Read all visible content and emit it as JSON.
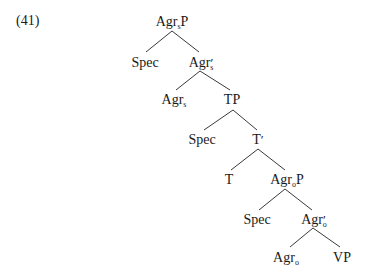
{
  "example": {
    "number": "(41)"
  },
  "tree": {
    "nodes": [
      {
        "id": "agrsp",
        "head": "Agr",
        "sub": "s",
        "suffix": "P",
        "prime": "",
        "x": 172,
        "y": 14
      },
      {
        "id": "spec1",
        "head": "Spec",
        "sub": "",
        "suffix": "",
        "prime": "",
        "x": 145,
        "y": 55
      },
      {
        "id": "agrsbar",
        "head": "Agr",
        "sub": "s",
        "suffix": "",
        "prime": "′",
        "x": 201,
        "y": 55
      },
      {
        "id": "agrs",
        "head": "Agr",
        "sub": "s",
        "suffix": "",
        "prime": "",
        "x": 174,
        "y": 92
      },
      {
        "id": "tp",
        "head": "TP",
        "sub": "",
        "suffix": "",
        "prime": "",
        "x": 232,
        "y": 92
      },
      {
        "id": "spec2",
        "head": "Spec",
        "sub": "",
        "suffix": "",
        "prime": "",
        "x": 202,
        "y": 132
      },
      {
        "id": "tbar",
        "head": "T",
        "sub": "",
        "suffix": "",
        "prime": "′",
        "x": 258,
        "y": 132
      },
      {
        "id": "t",
        "head": "T",
        "sub": "",
        "suffix": "",
        "prime": "",
        "x": 229,
        "y": 172
      },
      {
        "id": "agrop",
        "head": "Agr",
        "sub": "o",
        "suffix": "P",
        "prime": "",
        "x": 287,
        "y": 172
      },
      {
        "id": "spec3",
        "head": "Spec",
        "sub": "",
        "suffix": "",
        "prime": "",
        "x": 257,
        "y": 212
      },
      {
        "id": "agrobar",
        "head": "Agr",
        "sub": "o",
        "suffix": "",
        "prime": "′",
        "x": 314,
        "y": 212
      },
      {
        "id": "agro",
        "head": "Agr",
        "sub": "o",
        "suffix": "",
        "prime": "",
        "x": 286,
        "y": 250
      },
      {
        "id": "vp",
        "head": "VP",
        "sub": "",
        "suffix": "",
        "prime": "",
        "x": 342,
        "y": 250
      }
    ],
    "edges": [
      {
        "from": "agrsp",
        "to": "spec1",
        "x1": 172,
        "y1": 31,
        "x2": 146,
        "y2": 52
      },
      {
        "from": "agrsp",
        "to": "agrsbar",
        "x1": 172,
        "y1": 31,
        "x2": 199,
        "y2": 52
      },
      {
        "from": "agrsbar",
        "to": "agrs",
        "x1": 200,
        "y1": 71,
        "x2": 176,
        "y2": 90
      },
      {
        "from": "agrsbar",
        "to": "tp",
        "x1": 200,
        "y1": 71,
        "x2": 230,
        "y2": 90
      },
      {
        "from": "tp",
        "to": "spec2",
        "x1": 233,
        "y1": 110,
        "x2": 204,
        "y2": 130
      },
      {
        "from": "tp",
        "to": "tbar",
        "x1": 233,
        "y1": 110,
        "x2": 257,
        "y2": 130
      },
      {
        "from": "tbar",
        "to": "t",
        "x1": 258,
        "y1": 149,
        "x2": 231,
        "y2": 170
      },
      {
        "from": "tbar",
        "to": "agrop",
        "x1": 258,
        "y1": 149,
        "x2": 285,
        "y2": 170
      },
      {
        "from": "agrop",
        "to": "spec3",
        "x1": 285,
        "y1": 189,
        "x2": 259,
        "y2": 210
      },
      {
        "from": "agrop",
        "to": "agrobar",
        "x1": 285,
        "y1": 189,
        "x2": 312,
        "y2": 210
      },
      {
        "from": "agrobar",
        "to": "agro",
        "x1": 313,
        "y1": 228,
        "x2": 290,
        "y2": 247
      },
      {
        "from": "agrobar",
        "to": "vp",
        "x1": 313,
        "y1": 228,
        "x2": 340,
        "y2": 247
      }
    ]
  }
}
